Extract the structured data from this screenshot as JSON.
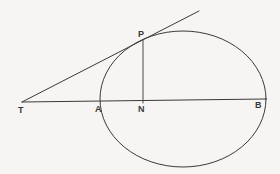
{
  "figure": {
    "kind": "geometry-diagram",
    "canvas": {
      "width": 280,
      "height": 174
    },
    "colors": {
      "background": "#f6f5f3",
      "stroke": "#3b3a38",
      "label": "#3b3a38"
    },
    "labels": [
      {
        "id": "label-T",
        "text": "T",
        "x": 18,
        "y": 113
      },
      {
        "id": "label-A",
        "text": "A",
        "x": 95,
        "y": 112
      },
      {
        "id": "label-N",
        "text": "N",
        "x": 138,
        "y": 112
      },
      {
        "id": "label-B",
        "text": "B",
        "x": 255,
        "y": 108
      },
      {
        "id": "label-P",
        "text": "P",
        "x": 138,
        "y": 37
      }
    ],
    "points": {
      "T": {
        "x": 22,
        "y": 102
      },
      "A": {
        "x": 100,
        "y": 101
      },
      "N": {
        "x": 143,
        "y": 102
      },
      "B": {
        "x": 266,
        "y": 99
      },
      "P": {
        "x": 143,
        "y": 40
      },
      "tangent_end": {
        "x": 199,
        "y": 11
      }
    },
    "ellipse": {
      "cx": 183,
      "cy": 99,
      "rx": 83,
      "ry": 68
    },
    "segments": [
      {
        "id": "segment-TB",
        "from": "T",
        "to": "B",
        "label": "T to B through A and N"
      },
      {
        "id": "segment-TP-tangent",
        "from": "T",
        "to": "tangent_end",
        "label": "tangent through P"
      },
      {
        "id": "segment-PN",
        "from": "P",
        "to": "N",
        "label": "perpendicular from P to AB"
      }
    ]
  }
}
